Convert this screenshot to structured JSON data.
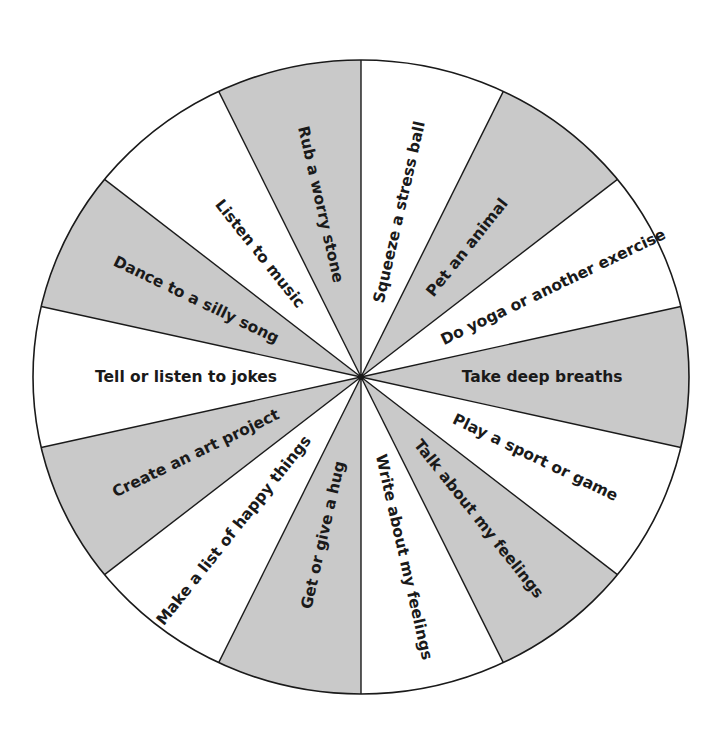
{
  "wheel": {
    "center": [
      361,
      377
    ],
    "radius_x": 328,
    "radius_y": 317,
    "start_angle_deg": -90,
    "colors": {
      "shaded": "#c9c9c9",
      "plain": "#ffffff",
      "stroke": "#1a1a1a",
      "text": "#1a1a1a"
    },
    "segments": [
      {
        "label": "Squeeze a stress ball",
        "shaded": false,
        "label_radius": 172
      },
      {
        "label": "Pet an animal",
        "shaded": true,
        "label_radius": 168
      },
      {
        "label": "Do yoga or another exercise",
        "shaded": false,
        "label_radius": 210
      },
      {
        "label": "Take deep breaths",
        "shaded": true,
        "label_radius": 178
      },
      {
        "label": "Play a sport or game",
        "shaded": false,
        "label_radius": 190
      },
      {
        "label": "Talk about my feelings",
        "shaded": true,
        "label_radius": 185
      },
      {
        "label": "Write about my feelings",
        "shaded": false,
        "label_radius": 188
      },
      {
        "label": "Get or give a hug",
        "shaded": true,
        "label_radius": 165
      },
      {
        "label": "Make a list of happy things",
        "shaded": false,
        "label_radius": 200
      },
      {
        "label": "Create an art project",
        "shaded": true,
        "label_radius": 180
      },
      {
        "label": "Tell or listen to jokes",
        "shaded": false,
        "label_radius": 172
      },
      {
        "label": "Dance to a silly song",
        "shaded": true,
        "label_radius": 180
      },
      {
        "label": "Listen to music",
        "shaded": false,
        "label_radius": 160
      },
      {
        "label": "Rub a worry stone",
        "shaded": true,
        "label_radius": 180
      }
    ]
  }
}
